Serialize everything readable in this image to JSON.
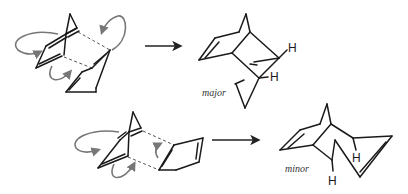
{
  "diagram": {
    "type": "Diels-Alder endo/exo reaction scheme",
    "reactions": [
      {
        "id": "top",
        "reactants": [
          "cyclopentadiene",
          "cyclopentadiene (endo approach)"
        ],
        "arrow": "forward-arrow",
        "product": {
          "label": "major",
          "atoms": [
            "H",
            "H"
          ]
        }
      },
      {
        "id": "bottom",
        "reactants": [
          "cyclopentadiene",
          "cyclopentadiene (exo approach)"
        ],
        "arrow": "forward-arrow",
        "product": {
          "label": "minor",
          "atoms": [
            "H",
            "H"
          ]
        }
      }
    ]
  },
  "labels": {
    "major": "major",
    "minor": "minor",
    "h_top_1": "H",
    "h_top_2": "H",
    "h_bot_1": "H",
    "h_bot_2": "H"
  },
  "colors": {
    "bond": "#1a1a1a",
    "curly_arrow": "#777777",
    "dashed_bond": "#555555"
  }
}
